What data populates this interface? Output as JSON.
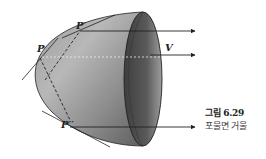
{
  "figure": {
    "labels": {
      "point_p": "P",
      "point_p_prime": "P′",
      "point_p_double_prime": "P′′",
      "focus_v": "V"
    },
    "caption": {
      "number": "그림 6.29",
      "title": "포물면 거울"
    },
    "colors": {
      "surface_dark": "#4a4a4a",
      "surface_light": "#bdbdbd",
      "line": "#222222"
    }
  }
}
